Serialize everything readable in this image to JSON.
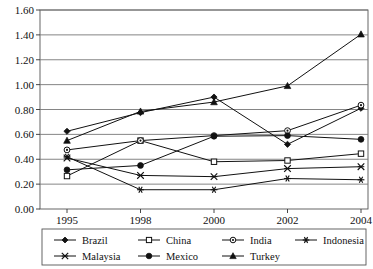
{
  "chart_data": {
    "type": "line",
    "title": "",
    "xlabel": "",
    "ylabel": "",
    "x": [
      "1995",
      "1998",
      "2000",
      "2002",
      "2004"
    ],
    "categories": [
      "1995",
      "1998",
      "2000",
      "2002",
      "2004"
    ],
    "ylim": [
      0.0,
      1.6
    ],
    "ytick_step": 0.2,
    "yticks": [
      "0.00",
      "0.20",
      "0.40",
      "0.60",
      "0.80",
      "1.00",
      "1.20",
      "1.40",
      "1.60"
    ],
    "ytick_values": [
      0.0,
      0.2,
      0.4,
      0.6,
      0.8,
      1.0,
      1.2,
      1.4,
      1.6
    ],
    "grid": "horizontal",
    "legend_position": "bottom",
    "series": [
      {
        "name": "Brazil",
        "marker": "diamond",
        "values": [
          0.625,
          0.775,
          0.9,
          0.52,
          0.81
        ]
      },
      {
        "name": "China",
        "marker": "open-square",
        "values": [
          0.265,
          0.55,
          0.38,
          0.39,
          0.445
        ]
      },
      {
        "name": "India",
        "marker": "dotted-circle",
        "values": [
          0.475,
          0.55,
          0.59,
          0.63,
          0.835
        ]
      },
      {
        "name": "Indonesia",
        "marker": "asterisk",
        "values": [
          0.42,
          0.155,
          0.155,
          0.245,
          0.235
        ]
      },
      {
        "name": "Malaysia",
        "marker": "x-star",
        "values": [
          0.41,
          0.27,
          0.26,
          0.325,
          0.34
        ]
      },
      {
        "name": "Mexico",
        "marker": "filled-circle",
        "values": [
          0.315,
          0.35,
          0.585,
          0.59,
          0.56
        ]
      },
      {
        "name": "Turkey",
        "marker": "filled-triangle",
        "values": [
          0.55,
          0.785,
          0.86,
          0.99,
          1.405
        ]
      }
    ]
  },
  "legend": {
    "row1": [
      "Brazil",
      "China",
      "India",
      "Indonesia"
    ],
    "row2": [
      "Malaysia",
      "Mexico",
      "Turkey"
    ]
  }
}
